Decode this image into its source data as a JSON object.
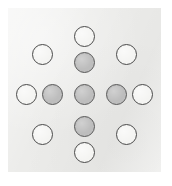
{
  "figure": {
    "panel": {
      "x": 8,
      "y": 8,
      "width": 153,
      "height": 164,
      "background_color": "#ececea"
    },
    "canvas": {
      "width": 172,
      "height": 186,
      "background_color": "#ffffff"
    },
    "legend": {
      "filled_label": "filled-node",
      "open_label": "open-node"
    }
  },
  "chart_data": {
    "type": "scatter",
    "title": "",
    "subtitle": "",
    "xlabel": "",
    "ylabel": "",
    "xlim": [
      0,
      4
    ],
    "ylim": [
      0,
      4
    ],
    "grid": false,
    "legend_position": "none",
    "tick_labels_x": [],
    "tick_labels_y": [],
    "annotations": [],
    "marker_diameter_px": 21,
    "colors": {
      "filled_fill": "#bdbdbd",
      "filled_stroke": "#5a5a5a",
      "open_fill": "#f4f4f2",
      "open_stroke": "#4a4a4a",
      "panel_background": "#ececea",
      "page_background": "#ffffff"
    },
    "series": [
      {
        "name": "filled-node",
        "marker": "filled-circle",
        "fill": "#bdbdbd",
        "stroke": "#5a5a5a",
        "points": [
          {
            "id": "center",
            "x": 2,
            "y": 2,
            "cx": 84,
            "cy": 94
          },
          {
            "id": "up",
            "x": 2,
            "y": 3,
            "cx": 84,
            "cy": 62
          },
          {
            "id": "down",
            "x": 2,
            "y": 1,
            "cx": 84,
            "cy": 126
          },
          {
            "id": "left",
            "x": 1,
            "y": 2,
            "cx": 52,
            "cy": 94
          },
          {
            "id": "right",
            "x": 3,
            "y": 2,
            "cx": 116,
            "cy": 94
          }
        ]
      },
      {
        "name": "open-node",
        "marker": "open-circle",
        "fill": "#f4f4f2",
        "stroke": "#4a4a4a",
        "points": [
          {
            "id": "top",
            "x": 2,
            "y": 4,
            "cx": 84,
            "cy": 36
          },
          {
            "id": "bottom",
            "x": 2,
            "y": 0,
            "cx": 84,
            "cy": 152
          },
          {
            "id": "far-left",
            "x": 0,
            "y": 2,
            "cx": 26,
            "cy": 94
          },
          {
            "id": "far-right",
            "x": 4,
            "y": 2,
            "cx": 142,
            "cy": 94
          },
          {
            "id": "top-left",
            "x": 1,
            "y": 3,
            "cx": 42,
            "cy": 54
          },
          {
            "id": "top-right",
            "x": 3,
            "y": 3,
            "cx": 126,
            "cy": 54
          },
          {
            "id": "bottom-left",
            "x": 1,
            "y": 1,
            "cx": 42,
            "cy": 134
          },
          {
            "id": "bottom-right",
            "x": 3,
            "y": 1,
            "cx": 126,
            "cy": 134
          }
        ]
      }
    ],
    "counts": {
      "filled": 5,
      "open": 8,
      "total": 13
    }
  }
}
